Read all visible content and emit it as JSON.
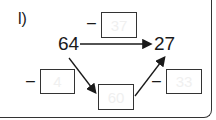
{
  "exercise": {
    "label": "l)",
    "start": "64",
    "end": "27",
    "operator": "–",
    "top_box": "37",
    "left_box": "4",
    "middle_box": "60",
    "right_box": "33"
  }
}
